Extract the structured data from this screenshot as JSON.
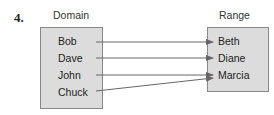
{
  "problem_number": "4.",
  "domain": {
    "label": "Domain",
    "items": [
      "Bob",
      "Dave",
      "John",
      "Chuck"
    ]
  },
  "range": {
    "label": "Range",
    "items": [
      "Beth",
      "Diane",
      "Marcia"
    ]
  },
  "mapping": [
    {
      "from": "Bob",
      "to": "Beth"
    },
    {
      "from": "Dave",
      "to": "Diane"
    },
    {
      "from": "John",
      "to": "Marcia"
    },
    {
      "from": "Chuck",
      "to": "Marcia"
    }
  ],
  "colors": {
    "box_fill": "#dcdcdc",
    "arrow": "#666666"
  }
}
